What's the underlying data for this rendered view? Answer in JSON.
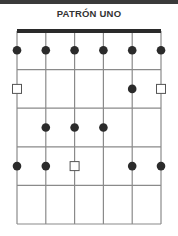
{
  "title": "PATRÓN UNO",
  "diagram": {
    "strings": 6,
    "frets": 5,
    "grid": {
      "left": 17,
      "right": 161,
      "top": 31,
      "fret_spacing": 38.6
    },
    "colors": {
      "line": "#8a8a8a",
      "nut": "#2a2a2a",
      "dot": "#2b2b2b",
      "root_fill": "#ffffff",
      "root_stroke": "#555555"
    },
    "markers": [
      {
        "fret": 1,
        "string": 1,
        "type": "dot"
      },
      {
        "fret": 1,
        "string": 2,
        "type": "dot"
      },
      {
        "fret": 1,
        "string": 3,
        "type": "dot"
      },
      {
        "fret": 1,
        "string": 4,
        "type": "dot"
      },
      {
        "fret": 1,
        "string": 5,
        "type": "dot"
      },
      {
        "fret": 1,
        "string": 6,
        "type": "dot"
      },
      {
        "fret": 2,
        "string": 1,
        "type": "root"
      },
      {
        "fret": 2,
        "string": 5,
        "type": "dot"
      },
      {
        "fret": 2,
        "string": 6,
        "type": "root"
      },
      {
        "fret": 3,
        "string": 2,
        "type": "dot"
      },
      {
        "fret": 3,
        "string": 3,
        "type": "dot"
      },
      {
        "fret": 3,
        "string": 4,
        "type": "dot"
      },
      {
        "fret": 4,
        "string": 1,
        "type": "dot"
      },
      {
        "fret": 4,
        "string": 2,
        "type": "dot"
      },
      {
        "fret": 4,
        "string": 3,
        "type": "root"
      },
      {
        "fret": 4,
        "string": 5,
        "type": "dot"
      },
      {
        "fret": 4,
        "string": 6,
        "type": "dot"
      }
    ]
  }
}
